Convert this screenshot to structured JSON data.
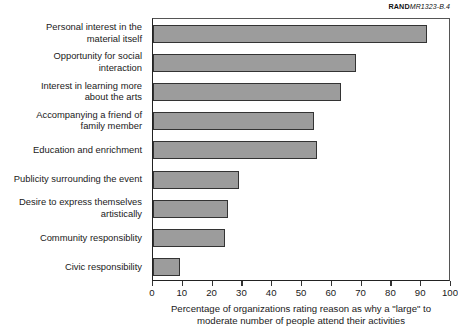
{
  "figure_id": {
    "prefix": "RAND",
    "number": "MR1323-B.4"
  },
  "chart_data": {
    "type": "bar",
    "orientation": "horizontal",
    "title": "",
    "subtitle": "",
    "xlabel": "Percentage of organizations rating reason as why a \"large\" to\nmoderate number of people attend their activities",
    "ylabel": "",
    "xlim": [
      0,
      100
    ],
    "xticks": [
      0,
      10,
      20,
      30,
      40,
      50,
      60,
      70,
      80,
      90,
      100
    ],
    "xtick_labels": [
      "0",
      "10",
      "20",
      "30",
      "40",
      "50",
      "60",
      "70",
      "80",
      "90",
      "100"
    ],
    "grid": false,
    "legend": null,
    "bar_color": "#9c9c9c",
    "bar_edge_color": "#333333",
    "categories": [
      "Personal interest in the\nmaterial itself",
      "Opportunity for social\ninteraction",
      "Interest in learning more\nabout the arts",
      "Accompanying a friend of\nfamily member",
      "Education and enrichment",
      "Publicity surrounding the event",
      "Desire to express themselves\nartistically",
      "Community responsiblity",
      "Civic responsibility"
    ],
    "values": [
      92,
      68,
      63,
      54,
      55,
      29,
      25,
      24,
      9
    ]
  }
}
